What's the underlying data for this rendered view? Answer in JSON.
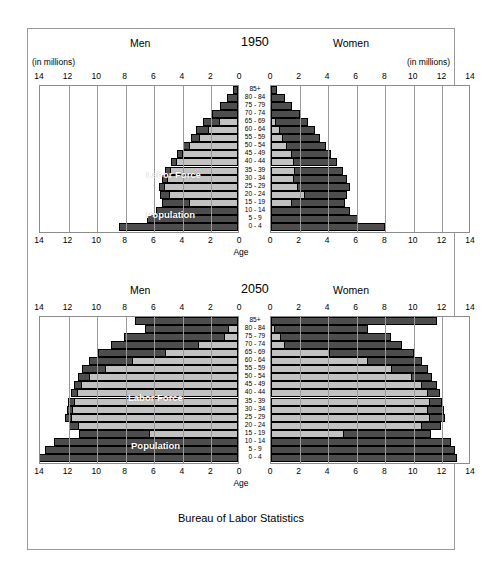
{
  "source_note": "Bureau of Labor Statistics",
  "axis": {
    "age_caption": "Age",
    "units_label": "(in millions)",
    "ticks": [
      14,
      12,
      10,
      8,
      6,
      4,
      2,
      0
    ],
    "max": 14,
    "tick_step": 2
  },
  "legend": {
    "labor_force": "Labor Force",
    "population": "Population",
    "color_population": "#4d4d4d",
    "color_labor_force": "#c2c2c2"
  },
  "age_groups": [
    "85+",
    "80 - 84",
    "75 - 79",
    "70 - 74",
    "65 - 69",
    "60 - 64",
    "55 - 59",
    "50 - 54",
    "45 - 49",
    "40 - 44",
    "35 - 39",
    "30 - 34",
    "25 - 29",
    "20 - 24",
    "15 - 19",
    "10 - 14",
    "5 - 9",
    "0 - 4"
  ],
  "panels": [
    {
      "id": "panel-1950",
      "year": "1950",
      "men_label": "Men",
      "women_label": "Women",
      "show_units": true
    },
    {
      "id": "panel-2050",
      "year": "2050",
      "men_label": "Men",
      "women_label": "Women",
      "show_units": false
    }
  ],
  "chart_data": [
    {
      "type": "bar",
      "subtype": "population-pyramid",
      "title": "1950",
      "xlabel": "(in millions)",
      "ylabel": "Age",
      "xlim": [
        0,
        14
      ],
      "grid": true,
      "categories": [
        "85+",
        "80 - 84",
        "75 - 79",
        "70 - 74",
        "65 - 69",
        "60 - 64",
        "55 - 59",
        "50 - 54",
        "45 - 49",
        "40 - 44",
        "35 - 39",
        "30 - 34",
        "25 - 29",
        "20 - 24",
        "15 - 19",
        "10 - 14",
        "5 - 9",
        "0 - 4"
      ],
      "series": [
        {
          "name": "Men Population",
          "side": "left",
          "values": [
            0.35,
            0.8,
            1.25,
            1.8,
            2.45,
            2.95,
            3.3,
            3.85,
            4.25,
            4.7,
            5.1,
            5.35,
            5.55,
            5.45,
            5.3,
            5.75,
            6.35,
            8.35
          ]
        },
        {
          "name": "Men Labor Force",
          "side": "left",
          "values": [
            0.0,
            0.0,
            0.0,
            0.0,
            1.3,
            2.1,
            2.75,
            3.4,
            3.9,
            4.35,
            4.75,
            5.0,
            5.15,
            4.85,
            3.45,
            0.0,
            0.0,
            0.0
          ]
        },
        {
          "name": "Women Population",
          "side": "right",
          "values": [
            0.4,
            0.95,
            1.45,
            2.0,
            2.6,
            3.1,
            3.4,
            3.85,
            4.2,
            4.6,
            5.05,
            5.3,
            5.55,
            5.35,
            5.2,
            5.55,
            6.1,
            8.0
          ]
        },
        {
          "name": "Women Labor Force",
          "side": "right",
          "values": [
            0.0,
            0.0,
            0.0,
            0.0,
            0.35,
            0.6,
            0.85,
            1.15,
            1.45,
            1.6,
            1.65,
            1.6,
            1.9,
            2.35,
            1.5,
            0.0,
            0.0,
            0.0
          ]
        }
      ]
    },
    {
      "type": "bar",
      "subtype": "population-pyramid",
      "title": "2050",
      "xlabel": "(in millions)",
      "ylabel": "Age",
      "xlim": [
        0,
        14
      ],
      "grid": true,
      "categories": [
        "85+",
        "80 - 84",
        "75 - 79",
        "70 - 74",
        "65 - 69",
        "60 - 64",
        "55 - 59",
        "50 - 54",
        "45 - 49",
        "40 - 44",
        "35 - 39",
        "30 - 34",
        "25 - 29",
        "20 - 24",
        "15 - 19",
        "10 - 14",
        "5 - 9",
        "0 - 4"
      ],
      "series": [
        {
          "name": "Men Population",
          "side": "left",
          "values": [
            7.2,
            6.5,
            8.0,
            8.9,
            9.8,
            10.4,
            10.9,
            11.2,
            11.5,
            11.7,
            11.9,
            12.0,
            12.1,
            11.8,
            11.1,
            12.9,
            13.5,
            13.9
          ]
        },
        {
          "name": "Men Labor Force",
          "side": "left",
          "values": [
            0.0,
            0.7,
            1.0,
            2.8,
            5.1,
            7.4,
            9.3,
            10.4,
            11.0,
            11.3,
            11.5,
            11.6,
            11.7,
            11.2,
            6.2,
            0.0,
            0.0,
            0.0
          ]
        },
        {
          "name": "Women Population",
          "side": "right",
          "values": [
            11.6,
            6.8,
            8.4,
            9.2,
            10.0,
            10.6,
            11.0,
            11.3,
            11.6,
            11.8,
            12.0,
            12.1,
            12.2,
            11.9,
            11.2,
            12.6,
            12.9,
            13.0
          ]
        },
        {
          "name": "Women Labor Force",
          "side": "right",
          "values": [
            0.0,
            0.25,
            0.7,
            1.0,
            4.1,
            6.8,
            8.5,
            9.9,
            10.6,
            11.0,
            11.1,
            11.0,
            11.1,
            10.6,
            5.1,
            0.0,
            0.0,
            0.0
          ]
        }
      ]
    }
  ]
}
